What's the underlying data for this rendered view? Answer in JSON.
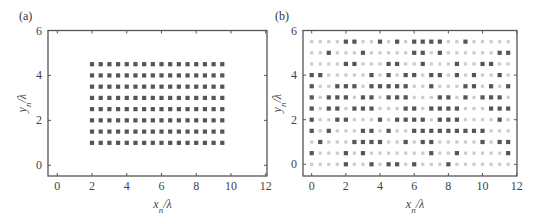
{
  "colors": {
    "on": "#555555",
    "off": "#cccccc",
    "frame": "#555555"
  },
  "chart_data": [
    {
      "panel": "(a)",
      "type": "scatter",
      "title": "",
      "xlabel": "x_n/λ",
      "ylabel": "y_n/λ",
      "xlim": [
        -0.5,
        12
      ],
      "ylim": [
        -0.5,
        6
      ],
      "xticks": [
        0,
        2,
        4,
        6,
        8,
        10,
        12
      ],
      "yticks": [
        0,
        2,
        4,
        6
      ],
      "grid": false,
      "legend": null,
      "description": "Uniform rectangular array of 16 x 8 elements, spacing 0.5λ",
      "x": [
        2,
        2.5,
        3,
        3.5,
        4,
        4.5,
        5,
        5.5,
        6,
        6.5,
        7,
        7.5,
        8,
        8.5,
        9,
        9.5
      ],
      "y": [
        1,
        1.5,
        2,
        2.5,
        3,
        3.5,
        4,
        4.5
      ],
      "active_all": true
    },
    {
      "panel": "(b)",
      "type": "scatter",
      "title": "",
      "xlabel": "x_n/λ",
      "ylabel": "y_n/λ",
      "xlim": [
        -0.5,
        12
      ],
      "ylim": [
        -0.5,
        6
      ],
      "xticks": [
        0,
        2,
        4,
        6,
        8,
        10,
        12
      ],
      "yticks": [
        0,
        2,
        4,
        6
      ],
      "grid": false,
      "legend": null,
      "description": "Sparse array on 24 x 12 grid (spacing 0.5λ); dark = active element, light = inactive",
      "x": [
        0,
        0.5,
        1,
        1.5,
        2,
        2.5,
        3,
        3.5,
        4,
        4.5,
        5,
        5.5,
        6,
        6.5,
        7,
        7.5,
        8,
        8.5,
        9,
        9.5,
        10,
        10.5,
        11,
        11.5
      ],
      "y": [
        0,
        0.5,
        1,
        1.5,
        2,
        2.5,
        3,
        3.5,
        4,
        4.5,
        5,
        5.5
      ],
      "active_by_row": {
        "5.5": [
          2,
          2.5,
          4,
          5,
          6,
          6.5,
          7,
          7.5,
          9
        ],
        "5": [
          1,
          3,
          6,
          6.5,
          7.5,
          11,
          11.5
        ],
        "4.5": [
          2,
          2.5,
          4.5,
          5,
          6.5,
          8.5,
          10,
          10.5
        ],
        "4": [
          0,
          0.5,
          3.5,
          4.5,
          5.5,
          6,
          7,
          7.5,
          8.5,
          9.5,
          11
        ],
        "3.5": [
          0,
          1.5,
          2,
          2.5,
          3.5,
          4,
          4.5,
          5,
          5.5,
          7,
          9,
          9.5,
          10.5,
          11.5
        ],
        "3": [
          0,
          1,
          1.5,
          2,
          3,
          3.5,
          4.5,
          5,
          5.5,
          7.5,
          8,
          9,
          10,
          10.5,
          11
        ],
        "2.5": [
          0,
          1,
          1.5,
          2.5,
          3,
          3.5,
          5.5,
          6,
          7,
          7.5,
          8,
          8.5,
          10.5,
          11,
          11.5
        ],
        "2": [
          0,
          1.5,
          2,
          4,
          5,
          5.5,
          6,
          6.5,
          7.5,
          8,
          8.5,
          11
        ],
        "1.5": [
          0,
          1,
          3,
          3.5,
          4.5,
          6,
          6.5,
          7,
          7.5,
          8,
          8.5,
          9,
          9.5,
          10
        ],
        "1": [
          0.5,
          2.5,
          3,
          3.5,
          4,
          5.5,
          6.5,
          7,
          10,
          11,
          11.5
        ],
        "0.5": [
          0,
          2,
          3,
          7,
          8.5,
          11.5
        ],
        "0": [
          2,
          3.5,
          4.5,
          5,
          6,
          8
        ]
      }
    }
  ],
  "layout": [
    {
      "frame": [
        48,
        30.5,
        267,
        176
      ],
      "x0px": 57.3,
      "x12px": 265.7,
      "y0px": 165.3,
      "y6px": 30.5,
      "label_pos": [
        19,
        20
      ]
    },
    {
      "frame": [
        303,
        30.5,
        517,
        176
      ],
      "x0px": 311.7,
      "x12px": 516.7,
      "y0px": 164.3,
      "y6px": 30.5,
      "label_pos": [
        275,
        20
      ]
    }
  ]
}
